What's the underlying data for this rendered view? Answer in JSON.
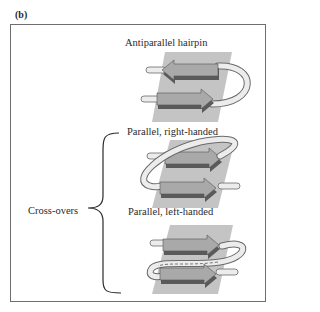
{
  "figure": {
    "panel_label": "(b)",
    "group_label": "Cross-overs",
    "diagrams": [
      {
        "id": "antiparallel-hairpin",
        "caption": "Antiparallel hairpin"
      },
      {
        "id": "parallel-right-handed",
        "caption": "Parallel, right-handed"
      },
      {
        "id": "parallel-left-handed",
        "caption": "Parallel, left-handed"
      }
    ],
    "colors": {
      "frame": "#6e6e6e",
      "plane": "#c4c4c4",
      "strand_top": "#a9a9a9",
      "strand_side": "#5a5a5a",
      "loop_fill": "#ececec",
      "loop_stroke": "#6a6a6a",
      "brace": "#2a2a2a"
    }
  }
}
